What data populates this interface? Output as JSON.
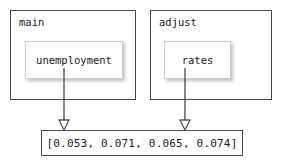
{
  "diagram": {
    "nodes": [
      {
        "id": "main",
        "label": "main",
        "inner": {
          "id": "unemployment",
          "label": "unemployment"
        }
      },
      {
        "id": "adjust",
        "label": "adjust",
        "inner": {
          "id": "rates",
          "label": "rates"
        }
      }
    ],
    "output": {
      "id": "values",
      "label": "[0.053, 0.071, 0.065, 0.074]",
      "values": [
        0.053,
        0.071,
        0.065,
        0.074
      ]
    },
    "edges": [
      {
        "from": "unemployment",
        "to": "values",
        "arrowhead": "hollow-triangle"
      },
      {
        "from": "rates",
        "to": "values",
        "arrowhead": "hollow-triangle"
      }
    ],
    "colors": {
      "outer_border": "#4a4a4a",
      "inner_border": "#c9c9c9",
      "text": "#1a1a1a",
      "background": "#ffffff",
      "connector": "#555555"
    }
  }
}
